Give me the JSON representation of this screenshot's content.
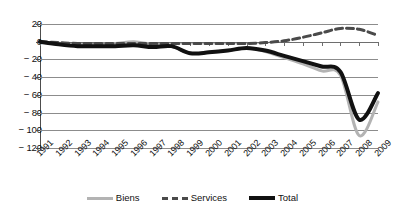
{
  "chart_data": {
    "type": "line",
    "title": "",
    "subtitle": "",
    "xlabel": "",
    "ylabel": "",
    "categories": [
      "1991",
      "1992",
      "1993",
      "1994",
      "1995",
      "1996",
      "1997",
      "1998",
      "1999",
      "2000",
      "2001",
      "2002",
      "2003",
      "2004",
      "2005",
      "2006",
      "2007",
      "2008",
      "2009"
    ],
    "ylim": [
      -120,
      20
    ],
    "yticks": [
      20,
      0,
      -20,
      -40,
      -60,
      -80,
      -100,
      -120
    ],
    "ytick_labels": [
      "20",
      "0",
      "− 20",
      "− 40",
      "− 60",
      "− 80",
      "− 100",
      "− 120"
    ],
    "grid": true,
    "legend_position": "bottom",
    "series": [
      {
        "name": "Biens",
        "color": "#b3b3b3",
        "style": "solid",
        "width": 3,
        "values": [
          0,
          -3,
          -4,
          -3,
          -2,
          0,
          -3,
          -5,
          -13,
          -12,
          -10,
          -7,
          -11,
          -18,
          -25,
          -33,
          -38,
          -106,
          -68
        ]
      },
      {
        "name": "Services",
        "color": "#4a4a4a",
        "style": "dashed",
        "width": 3,
        "values": [
          0,
          -1,
          -2,
          -2,
          -2,
          -2,
          -2,
          -2,
          -2,
          -2,
          -2,
          -2,
          -1,
          1,
          5,
          10,
          15,
          14,
          7
        ]
      },
      {
        "name": "Total",
        "color": "#111111",
        "style": "solid",
        "width": 4,
        "values": [
          0,
          -3,
          -5,
          -5,
          -5,
          -4,
          -6,
          -5,
          -13,
          -12,
          -10,
          -7,
          -10,
          -16,
          -22,
          -28,
          -34,
          -88,
          -58
        ]
      }
    ]
  },
  "legend": {
    "items": [
      {
        "label": "Biens"
      },
      {
        "label": "Services"
      },
      {
        "label": "Total"
      }
    ]
  },
  "axes": {
    "y_ticks": [
      {
        "label": "20"
      },
      {
        "label": "0"
      },
      {
        "label": "− 20"
      },
      {
        "label": "− 40"
      },
      {
        "label": "− 60"
      },
      {
        "label": "− 80"
      },
      {
        "label": "− 100"
      },
      {
        "label": "− 120"
      }
    ]
  }
}
